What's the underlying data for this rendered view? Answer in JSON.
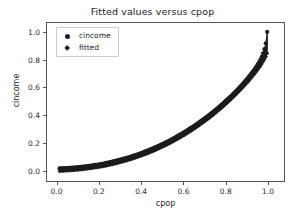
{
  "chart_data": {
    "type": "scatter",
    "title": "Fitted values versus cpop",
    "xlabel": "cpop",
    "ylabel": "cincome",
    "xlim": [
      -0.05,
      1.08
    ],
    "ylim": [
      -0.08,
      1.07
    ],
    "grid": false,
    "legend_position": "upper left",
    "xticks": [
      "0.0",
      "0.2",
      "0.4",
      "0.6",
      "0.8",
      "1.0"
    ],
    "xtick_values": [
      0.0,
      0.2,
      0.4,
      0.6,
      0.8,
      1.0
    ],
    "yticks": [
      "0.0",
      "0.2",
      "0.4",
      "0.6",
      "0.8",
      "1.0"
    ],
    "ytick_values": [
      0.0,
      0.2,
      0.4,
      0.6,
      0.8,
      1.0
    ],
    "series": [
      {
        "name": "cincome",
        "marker": "circle",
        "color": "#1c1c1c",
        "x": [
          0.01,
          0.03,
          0.05,
          0.08,
          0.1,
          0.13,
          0.16,
          0.19,
          0.22,
          0.25,
          0.28,
          0.31,
          0.34,
          0.37,
          0.4,
          0.43,
          0.46,
          0.49,
          0.52,
          0.55,
          0.58,
          0.61,
          0.64,
          0.67,
          0.7,
          0.73,
          0.76,
          0.79,
          0.82,
          0.85,
          0.88,
          0.9,
          0.92,
          0.94,
          0.955,
          0.968,
          0.978,
          0.986,
          0.992,
          0.996,
          0.999,
          1.0
        ],
        "y": [
          0.012,
          0.013,
          0.015,
          0.018,
          0.021,
          0.026,
          0.032,
          0.039,
          0.047,
          0.057,
          0.068,
          0.08,
          0.093,
          0.108,
          0.124,
          0.142,
          0.161,
          0.182,
          0.204,
          0.228,
          0.254,
          0.281,
          0.31,
          0.341,
          0.374,
          0.409,
          0.446,
          0.486,
          0.528,
          0.573,
          0.622,
          0.657,
          0.694,
          0.735,
          0.77,
          0.805,
          0.84,
          0.875,
          0.91,
          0.945,
          0.98,
          1.005
        ]
      },
      {
        "name": "fitted",
        "marker": "diamond",
        "color": "#1c1c1c",
        "x": [
          0.01,
          0.03,
          0.05,
          0.08,
          0.1,
          0.13,
          0.16,
          0.19,
          0.22,
          0.25,
          0.28,
          0.31,
          0.34,
          0.37,
          0.4,
          0.43,
          0.46,
          0.49,
          0.52,
          0.55,
          0.58,
          0.61,
          0.64,
          0.67,
          0.7,
          0.73,
          0.76,
          0.79,
          0.82,
          0.85,
          0.88,
          0.9,
          0.92,
          0.94,
          0.955,
          0.968,
          0.978,
          0.986,
          0.992,
          0.996,
          0.999,
          1.0
        ],
        "y": [
          -0.008,
          -0.006,
          -0.004,
          -0.001,
          0.002,
          0.007,
          0.013,
          0.02,
          0.028,
          0.037,
          0.048,
          0.06,
          0.073,
          0.088,
          0.104,
          0.121,
          0.14,
          0.161,
          0.183,
          0.207,
          0.232,
          0.259,
          0.288,
          0.319,
          0.352,
          0.386,
          0.423,
          0.462,
          0.504,
          0.548,
          0.595,
          0.628,
          0.663,
          0.7,
          0.73,
          0.758,
          0.782,
          0.803,
          0.82,
          0.834,
          0.845,
          0.85
        ]
      }
    ]
  },
  "legend": {
    "items": [
      {
        "label": "cincome",
        "marker": "circle"
      },
      {
        "label": "fitted",
        "marker": "diamond"
      }
    ]
  }
}
